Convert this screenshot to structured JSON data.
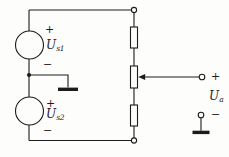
{
  "figure": {
    "kind": "circuit-diagram"
  },
  "colors": {
    "line": "#1c1c1c",
    "background": "#fdfdfc"
  },
  "labels": {
    "source_top": {
      "plus": "+",
      "base": "U",
      "sub": "s1",
      "minus": "−"
    },
    "source_bottom": {
      "plus": "+",
      "base": "U",
      "sub": "s2",
      "minus": "−"
    },
    "output": {
      "plus": "+",
      "base": "U",
      "sub": "a",
      "minus": "−"
    }
  }
}
